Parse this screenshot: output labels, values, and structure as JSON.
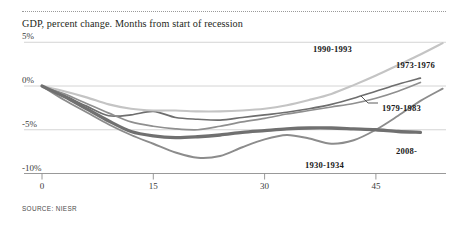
{
  "chart_data": {
    "type": "line",
    "title": "GDP, percent change. Months from start of recession",
    "xlabel": "Months from start of recession",
    "ylabel": "GDP, percent change",
    "xlim": [
      0,
      57
    ],
    "ylim": [
      -10,
      5
    ],
    "xticks": [
      0,
      15,
      30,
      45
    ],
    "xtick_labels": [
      "0",
      "15",
      "30",
      "45"
    ],
    "yticks": [
      5,
      0,
      -5,
      -10
    ],
    "ytick_labels": [
      "5%",
      "0%",
      "-5%",
      "-10%"
    ],
    "grid": "horizontal",
    "legend": "inline-annotations",
    "source": "SOURCE: NIESR",
    "series": [
      {
        "name": "1930-1934",
        "color": "#8c8c8c",
        "width": 1.9,
        "label_x": 305,
        "label_y": 160,
        "x": [
          0,
          3,
          6,
          9,
          12,
          15,
          18,
          21,
          24,
          27,
          30,
          33,
          36,
          39,
          42,
          45,
          48,
          51,
          54
        ],
        "y": [
          0.0,
          -1.6,
          -3.0,
          -4.4,
          -5.6,
          -6.6,
          -7.6,
          -8.2,
          -8.0,
          -7.0,
          -6.1,
          -5.6,
          -6.0,
          -6.6,
          -6.2,
          -5.0,
          -3.4,
          -1.7,
          -0.3
        ]
      },
      {
        "name": "1973-1976",
        "color": "#6e6e6e",
        "width": 1.7,
        "label_x": 396,
        "label_y": 60,
        "x": [
          0,
          3,
          6,
          9,
          12,
          15,
          18,
          21,
          24,
          27,
          30,
          33,
          36,
          39,
          42,
          45,
          48,
          51
        ],
        "y": [
          0.0,
          -1.1,
          -2.3,
          -3.4,
          -3.3,
          -2.9,
          -3.6,
          -3.8,
          -3.9,
          -3.6,
          -3.3,
          -3.0,
          -2.6,
          -2.1,
          -1.4,
          -0.6,
          0.2,
          0.9
        ]
      },
      {
        "name": "1979-1983",
        "color": "#8f8f8f",
        "width": 1.7,
        "label_x": 382,
        "label_y": 103,
        "x": [
          0,
          3,
          6,
          9,
          12,
          15,
          18,
          21,
          24,
          27,
          30,
          33,
          36,
          39,
          42,
          45,
          48,
          51
        ],
        "y": [
          0.0,
          -0.9,
          -2.0,
          -3.1,
          -4.1,
          -4.6,
          -4.9,
          -5.0,
          -4.6,
          -4.1,
          -3.7,
          -3.2,
          -2.8,
          -2.4,
          -2.0,
          -1.4,
          -0.6,
          0.4
        ]
      },
      {
        "name": "1990-1993",
        "color": "#c4c4c4",
        "width": 2.1,
        "label_x": 313,
        "label_y": 44,
        "x": [
          0,
          3,
          6,
          9,
          12,
          15,
          18,
          21,
          24,
          27,
          30,
          33,
          36,
          39,
          42,
          45,
          48,
          51,
          54
        ],
        "y": [
          0.0,
          -0.6,
          -1.3,
          -2.1,
          -2.6,
          -2.8,
          -2.8,
          -2.9,
          -2.9,
          -2.8,
          -2.6,
          -2.2,
          -1.6,
          -0.9,
          0.1,
          1.2,
          2.4,
          3.6,
          4.9
        ]
      },
      {
        "name": "2008-",
        "color": "#707070",
        "width": 3.3,
        "label_x": 396,
        "label_y": 146,
        "x": [
          0,
          3,
          6,
          9,
          12,
          15,
          18,
          21,
          24,
          27,
          30,
          33,
          36,
          39,
          42,
          45,
          48,
          51
        ],
        "y": [
          0.0,
          -1.2,
          -2.6,
          -4.0,
          -5.2,
          -5.7,
          -5.9,
          -5.8,
          -5.6,
          -5.3,
          -5.1,
          -4.9,
          -4.8,
          -4.8,
          -4.9,
          -5.0,
          -5.2,
          -5.3
        ]
      }
    ]
  }
}
